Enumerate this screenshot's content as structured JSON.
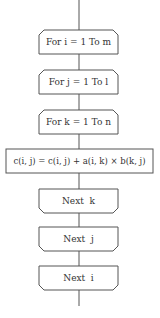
{
  "diagram": {
    "type": "flowchart",
    "title": "",
    "colors": {
      "stroke": "#555555",
      "text": "#333333",
      "background": "#ffffff"
    },
    "nodes": [
      {
        "id": "loop_i_start",
        "shape": "loop-start",
        "label": "For i = 1 To m"
      },
      {
        "id": "loop_j_start",
        "shape": "loop-start",
        "label": "For j = 1 To l"
      },
      {
        "id": "loop_k_start",
        "shape": "loop-start",
        "label": "For k = 1 To n"
      },
      {
        "id": "process",
        "shape": "process",
        "label": "c(i, j) = c(i, j) + a(i, k) × b(k, j)"
      },
      {
        "id": "loop_k_end",
        "shape": "loop-end",
        "label": "Next  k"
      },
      {
        "id": "loop_j_end",
        "shape": "loop-end",
        "label": "Next  j"
      },
      {
        "id": "loop_i_end",
        "shape": "loop-end",
        "label": "Next  i"
      }
    ],
    "edges": [
      [
        "start",
        "loop_i_start"
      ],
      [
        "loop_i_start",
        "loop_j_start"
      ],
      [
        "loop_j_start",
        "loop_k_start"
      ],
      [
        "loop_k_start",
        "process"
      ],
      [
        "process",
        "loop_k_end"
      ],
      [
        "loop_k_end",
        "loop_j_end"
      ],
      [
        "loop_j_end",
        "loop_i_end"
      ],
      [
        "loop_i_end",
        "end"
      ]
    ]
  }
}
